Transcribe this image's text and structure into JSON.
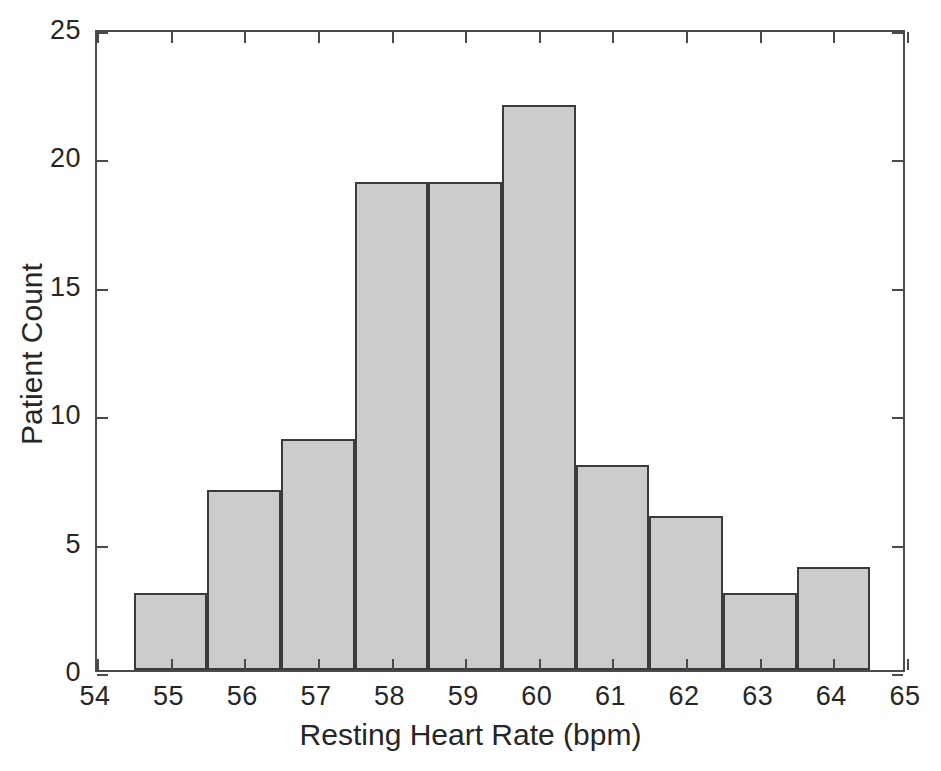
{
  "chart_data": {
    "type": "bar",
    "title": "",
    "subtitle": "",
    "xlabel": "Resting Heart Rate (bpm)",
    "ylabel": "Patient Count",
    "categories": [
      55,
      56,
      57,
      58,
      59,
      60,
      61,
      62,
      63,
      64
    ],
    "values": [
      3,
      7,
      9,
      19,
      19,
      22,
      8,
      6,
      3,
      4
    ],
    "bin_edges": [
      54.5,
      55.5,
      56.5,
      57.5,
      58.5,
      59.5,
      60.5,
      61.5,
      62.5,
      63.5,
      64.5
    ],
    "bin_width": 1,
    "xlim": [
      54,
      65
    ],
    "ylim": [
      0,
      25
    ],
    "xticks": [
      54,
      55,
      56,
      57,
      58,
      59,
      60,
      61,
      62,
      63,
      64,
      65
    ],
    "xticklabels": [
      "54",
      "55",
      "56",
      "57",
      "58",
      "59",
      "60",
      "61",
      "62",
      "63",
      "64",
      "65"
    ],
    "yticks": [
      0,
      5,
      10,
      15,
      20,
      25
    ],
    "yticklabels": [
      "0",
      "5",
      "10",
      "15",
      "20",
      "25"
    ],
    "grid": false,
    "legend": null,
    "legend_position": "none",
    "annotations": [],
    "colors": {
      "bar_fill": "#cccccc",
      "bar_edge": "#3b3b3b",
      "axis": "#4a4a4a",
      "text": "#262626",
      "background": "#ffffff"
    }
  }
}
